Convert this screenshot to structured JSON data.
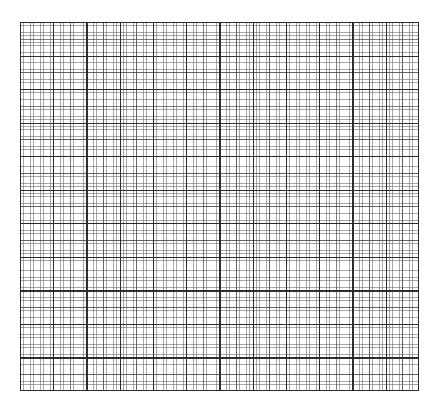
{
  "page": {
    "kind": "graph-paper",
    "background_color": "#ffffff",
    "width_px": 439,
    "height_px": 410
  },
  "sheet": {
    "name": "graph-paper-sheet",
    "left_px": 20,
    "top_px": 22,
    "width_px": 399,
    "height_px": 369,
    "frame_color": "#2b2b31",
    "frame_width_px": 1.2,
    "fill_color": "#ffffff"
  },
  "grid": {
    "fine": {
      "label": "fine grid",
      "spacing_x_px": 3.325,
      "spacing_y_px": 3.3545,
      "line_color": "#5f5f64",
      "line_width_px": 0.6,
      "columns": 120,
      "rows": 110
    },
    "medium": {
      "label": "medium grid",
      "spacing_x_px": 16.625,
      "spacing_y_px": 16.7727,
      "line_color": "#46464c",
      "line_width_px": 0.8,
      "every_n_fine": 5
    },
    "major": {
      "label": "major grid",
      "spacing_x_px": 33.25,
      "spacing_y_px": 33.5454,
      "line_color": "#26262c",
      "line_width_px": 1.15,
      "every_n_fine": 10,
      "columns": 12,
      "rows": 11
    }
  },
  "chart_data": {
    "type": "table",
    "title": "",
    "xlabel": "",
    "ylabel": "",
    "categories": [],
    "values": [],
    "grid": true,
    "legend": "none",
    "note": "Blank graph paper: 12 x 11 major cells, each subdivided into 10 x 10 fine cells. No plotted data, axis tick labels, legend, or annotations are present."
  }
}
